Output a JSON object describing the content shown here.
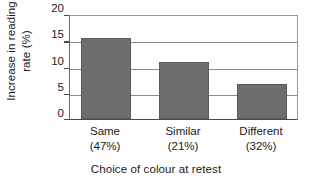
{
  "chart_data": {
    "type": "bar",
    "title": "",
    "categories": [
      "Same",
      "Similar",
      "Different"
    ],
    "category_sublabels": [
      "(47%)",
      "(21%)",
      "(32%)"
    ],
    "values": [
      15.5,
      10.8,
      6.6
    ],
    "xlabel": "Choice of colour at retest",
    "ylabel_line1": "Increase in reading",
    "ylabel_line2": "rate (%)",
    "ylabel": "Increase in reading rate (%)",
    "ylim": [
      0,
      20
    ],
    "yticks": [
      0,
      5,
      10,
      15,
      20
    ],
    "ytick_labels": [
      "0",
      "5",
      "10",
      "15",
      "20"
    ],
    "grid": true,
    "grid_axis": "y",
    "legend": false,
    "bar_color": "#6e6e6e",
    "axis_color": "#4a4a4a",
    "background_color": "#ffffff"
  }
}
